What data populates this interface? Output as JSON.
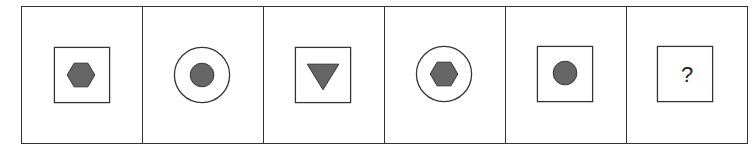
{
  "puzzle": {
    "cells": [
      {
        "frame": "square",
        "inner": "hexagon"
      },
      {
        "frame": "circle",
        "inner": "circle"
      },
      {
        "frame": "square",
        "inner": "triangle-down"
      },
      {
        "frame": "circle",
        "inner": "hexagon"
      },
      {
        "frame": "square",
        "inner": "circle"
      },
      {
        "frame": "square",
        "inner": "question",
        "label": "?"
      }
    ],
    "colors": {
      "stroke": "#333333",
      "fill": "#666666"
    }
  }
}
